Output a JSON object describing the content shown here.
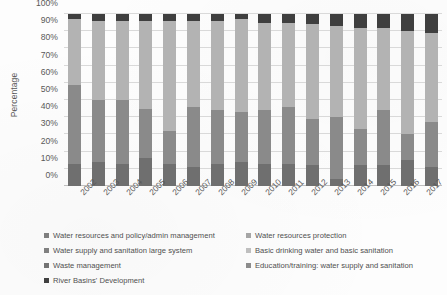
{
  "axes": {
    "ylabel": "Percentage",
    "yticks": [
      "0%",
      "10%",
      "20%",
      "30%",
      "40%",
      "50%",
      "60%",
      "70%",
      "80%",
      "90%",
      "100%"
    ]
  },
  "legend": {
    "items": [
      {
        "label": "Water resources and policy/admin management",
        "color": "#7f7f7f"
      },
      {
        "label": "Water resources protection",
        "color": "#a6a6a6"
      },
      {
        "label": "Water supply and sanitation large system",
        "color": "#808080"
      },
      {
        "label": "Basic drinking water and basic sanitation",
        "color": "#bfbfbf"
      },
      {
        "label": "Waste management",
        "color": "#737373"
      },
      {
        "label": "Education/training: water supply and sanitation",
        "color": "#8c8c8c"
      },
      {
        "label": "River Basins' Development",
        "color": "#404040"
      }
    ]
  },
  "chart_data": {
    "type": "bar",
    "title": "",
    "xlabel": "",
    "ylabel": "Percentage",
    "ylim": [
      0,
      100
    ],
    "stacked": true,
    "normalized_100pct": true,
    "grid": true,
    "legend_position": "bottom",
    "categories": [
      "2002",
      "2003",
      "2004",
      "2005",
      "2006",
      "2007",
      "2008",
      "2009",
      "2010",
      "2011",
      "2012",
      "2013",
      "2014",
      "2015",
      "2016",
      "2017"
    ],
    "series": [
      {
        "name": "Water resources and policy/admin management",
        "color": "#6f6f6f",
        "values": [
          13,
          14,
          13,
          16,
          13,
          11,
          13,
          14,
          13,
          13,
          12,
          4,
          12,
          12,
          15,
          11
        ]
      },
      {
        "name": "Water resources protection",
        "color": "#8a8a8a",
        "values": [
          46,
          36,
          37,
          29,
          19,
          35,
          31,
          29,
          31,
          33,
          27,
          36,
          21,
          32,
          15,
          26
        ]
      },
      {
        "name": "Water supply and sanitation large system",
        "color": "#b3b3b3",
        "values": [
          38,
          46,
          46,
          51,
          64,
          50,
          52,
          54,
          51,
          49,
          55,
          53,
          59,
          48,
          60,
          52
        ]
      },
      {
        "name": "Basic drinking water and basic sanitation",
        "color": "#cccccc",
        "values": [
          0,
          0,
          0,
          0,
          0,
          0,
          0,
          0,
          0,
          0,
          0,
          0,
          0,
          0,
          0,
          0
        ]
      },
      {
        "name": "Waste management",
        "color": "#a0a0a0",
        "values": [
          0,
          0,
          0,
          0,
          0,
          0,
          0,
          0,
          0,
          0,
          0,
          0,
          0,
          0,
          0,
          0
        ]
      },
      {
        "name": "Education/training: water supply and sanitation",
        "color": "#9a9a9a",
        "values": [
          0,
          0,
          0,
          0,
          0,
          0,
          0,
          0,
          0,
          0,
          0,
          0,
          0,
          0,
          0,
          0
        ]
      },
      {
        "name": "River Basins' Development",
        "color": "#3f3f3f",
        "values": [
          3,
          4,
          4,
          4,
          4,
          4,
          4,
          3,
          5,
          5,
          6,
          7,
          8,
          8,
          10,
          11
        ]
      }
    ]
  }
}
